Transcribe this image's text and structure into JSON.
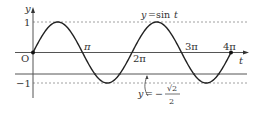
{
  "chart_data": {
    "type": "line",
    "title": "",
    "xlabel": "t",
    "ylabel": "y",
    "origin_label": "O",
    "xlim": [
      0,
      12.566
    ],
    "ylim": [
      -1,
      1
    ],
    "x_ticks": [
      {
        "value": 3.1416,
        "label": "π"
      },
      {
        "value": 6.2832,
        "label": "2π"
      },
      {
        "value": 9.4248,
        "label": "3π"
      },
      {
        "value": 12.566,
        "label": "4π"
      }
    ],
    "y_ticks": [
      {
        "value": 1,
        "label": "1"
      },
      {
        "value": -1,
        "label": "−1"
      }
    ],
    "series": [
      {
        "name": "y = sin t",
        "function": "sin(t)",
        "domain": [
          0,
          12.566
        ],
        "style": "solid",
        "endpoints": "filled dots at t=0 and t=4π"
      }
    ],
    "reference_lines": [
      {
        "y": 1,
        "style": "dashed"
      },
      {
        "y": -1,
        "style": "dashed"
      },
      {
        "y": -0.7071,
        "style": "solid",
        "label": "y = −√2/2"
      }
    ],
    "annotations": [
      {
        "text": "y = sin t",
        "position": "above curve near 2π–3π"
      },
      {
        "text": "y = −√2/2",
        "position": "below, arrow pointing to line y=−√2/2"
      }
    ],
    "grid": false,
    "legend": "none"
  },
  "labels": {
    "y_axis": "y",
    "t_axis": "t",
    "origin": "O",
    "y_one": "1",
    "y_minus_one": "−1",
    "pi": "π",
    "two_pi": "2π",
    "three_pi": "3π",
    "four_pi": "4π",
    "curve_y": "y",
    "curve_eq": "=",
    "curve_fn": "sin",
    "curve_var": "t",
    "line_y": "y",
    "line_eq": "=",
    "line_minus": "−",
    "line_sqrt": "√2",
    "line_den": "2"
  }
}
